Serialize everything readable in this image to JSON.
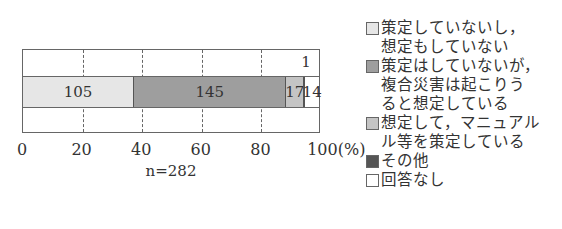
{
  "chart_data": {
    "type": "bar",
    "orientation": "horizontal-stacked-100",
    "title": "",
    "xlabel": "n=282",
    "ylabel": "",
    "xlim": [
      0,
      100
    ],
    "x_unit": "(%)",
    "grid": {
      "x": true,
      "style": "dashed"
    },
    "ticks": [
      "0",
      "20",
      "40",
      "60",
      "80",
      "100(%)"
    ],
    "n_label": "n=282",
    "series": [
      {
        "name": "策定していないし，想定もしていない",
        "value": 105,
        "color": "#e6e6e6",
        "label": "105"
      },
      {
        "name": "策定はしていないが，複合災害は起こりうると想定している",
        "value": 145,
        "color": "#9e9e9e",
        "label": "145"
      },
      {
        "name": "想定して，マニュアル等を策定している",
        "value": 17,
        "color": "#c4c4c4",
        "label": "17"
      },
      {
        "name": "その他",
        "value": 1,
        "color": "#555555",
        "label": "1"
      },
      {
        "name": "回答なし",
        "value": 14,
        "color": "#ffffff",
        "label": "14"
      }
    ],
    "total": 282,
    "legend_position": "right"
  },
  "legend": [
    {
      "text": "策定していないし，\n想定もしていない",
      "color": "#e6e6e6"
    },
    {
      "text": "策定はしていないが，\n複合災害は起こりう\nると想定している",
      "color": "#9e9e9e"
    },
    {
      "text": "想定して，マニュアル\nル等を策定している",
      "color": "#c4c4c4"
    },
    {
      "text": "その他",
      "color": "#555555"
    },
    {
      "text": "回答なし",
      "color": "#ffffff"
    }
  ]
}
